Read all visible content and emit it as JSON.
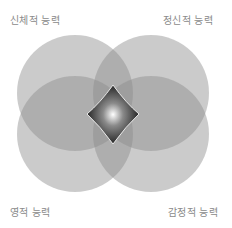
{
  "diagram": {
    "type": "four-circle venn",
    "labels": {
      "top_left": "신체적 능력",
      "top_right": "정신적 능력",
      "bottom_left": "영적 능력",
      "bottom_right": "감정적 능력"
    },
    "colors": {
      "circle_fill": "#9a9a9a",
      "center_dark": "#1a1a1a",
      "center_highlight": "#ffffff",
      "label_text": "#8a8a8a"
    }
  }
}
